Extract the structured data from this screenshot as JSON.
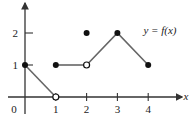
{
  "chart_data": {
    "type": "line",
    "title": "",
    "annotation": "y = f(x)",
    "xlabel": "x",
    "ylabel": "y",
    "xlim": [
      -0.2,
      4.5
    ],
    "ylim": [
      -0.5,
      3
    ],
    "x_ticks": [
      1,
      2,
      3,
      4
    ],
    "x_tick_labels": [
      "1",
      "2",
      "3",
      "4"
    ],
    "y_ticks": [
      1,
      2
    ],
    "y_tick_labels": [
      "1",
      "2"
    ],
    "origin_label": "0",
    "grid": false,
    "series": [
      {
        "name": "segment-1",
        "points": [
          [
            0,
            1
          ],
          [
            1,
            0
          ]
        ]
      },
      {
        "name": "segment-2",
        "points": [
          [
            1,
            1
          ],
          [
            2,
            1
          ]
        ]
      },
      {
        "name": "segment-3",
        "points": [
          [
            2,
            1
          ],
          [
            3,
            2
          ],
          [
            4,
            1
          ]
        ]
      }
    ],
    "closed_points": [
      [
        0,
        1
      ],
      [
        1,
        1
      ],
      [
        2,
        2
      ],
      [
        3,
        2
      ],
      [
        4,
        1
      ]
    ],
    "open_points": [
      [
        1,
        0
      ],
      [
        2,
        1
      ]
    ]
  }
}
